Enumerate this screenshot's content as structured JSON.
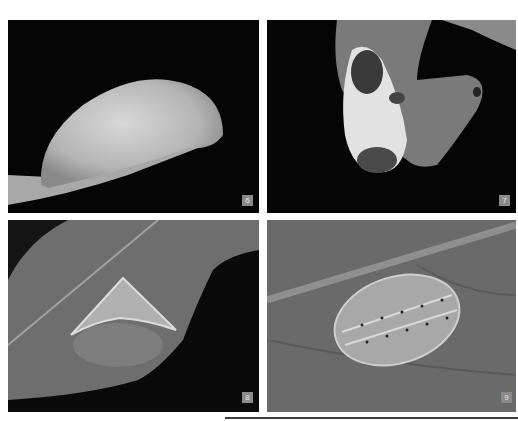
{
  "page": {
    "layout": "2x2 photo grid",
    "background": "#ffffff"
  },
  "figures": [
    {
      "id": "6",
      "label": "6",
      "description": "Smooth pale dome-shaped insect resting on a leaf edge against black background"
    },
    {
      "id": "7",
      "label": "7",
      "description": "Mottled white and dark larva on a leaf with holes, black background"
    },
    {
      "id": "8",
      "label": "8",
      "description": "Triangular keeled pale insect on a leaf, dark background at right"
    },
    {
      "id": "9",
      "label": "9",
      "description": "Oval translucent spiny larva with dotted rows on veined leaf underside"
    }
  ],
  "colors": {
    "badge_bg": "#8a8a8a",
    "badge_text": "#e8e8e8",
    "photo_black": "#050505",
    "rule": "#3a3a3a"
  }
}
